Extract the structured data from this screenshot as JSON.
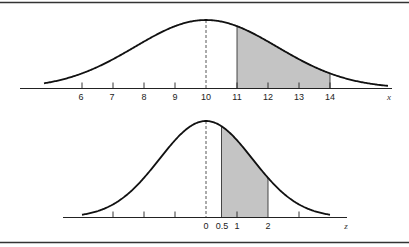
{
  "chart_data": [
    {
      "type": "area",
      "title": "",
      "description": "Normal distribution of x with shaded region between 11 and 14",
      "xlabel": "x",
      "ylabel": "",
      "mean": 10,
      "tick_labels": [
        "6",
        "7",
        "8",
        "9",
        "10",
        "11",
        "12",
        "13",
        "14"
      ],
      "tick_values": [
        6,
        7,
        8,
        9,
        10,
        11,
        12,
        13,
        14
      ],
      "shaded_interval": [
        11,
        14
      ],
      "mean_line": "dashed",
      "grid": false
    },
    {
      "type": "area",
      "title": "",
      "description": "Standard normal distribution of z with shaded region between 0.5 and 2",
      "xlabel": "z",
      "ylabel": "",
      "mean": 0,
      "tick_labels": [
        "0",
        "0.5",
        "1",
        "2"
      ],
      "tick_values": [
        0,
        0.5,
        1,
        2
      ],
      "unlabeled_ticks": [
        -3,
        -2,
        -1,
        3
      ],
      "shaded_interval": [
        0.5,
        2
      ],
      "mean_line": "dashed",
      "grid": false
    }
  ],
  "top": {
    "axis_label": "x",
    "ticks": [
      "6",
      "7",
      "8",
      "9",
      "10",
      "11",
      "12",
      "13",
      "14"
    ]
  },
  "bottom": {
    "axis_label": "z",
    "ticks": [
      "0",
      "0.5",
      "1",
      "2"
    ]
  },
  "colors": {
    "shade": "#c4c4c4",
    "line": "#111111"
  }
}
